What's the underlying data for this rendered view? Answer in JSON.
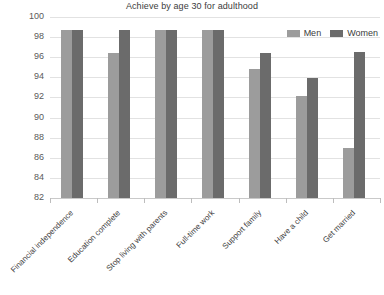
{
  "chart_data": {
    "type": "bar",
    "title": "Achieve by age 30 for adulthood",
    "xlabel": "",
    "ylabel": "",
    "ylim": [
      82,
      100
    ],
    "yticks": [
      82,
      84,
      86,
      88,
      90,
      92,
      94,
      96,
      98,
      100
    ],
    "grid": true,
    "legend_position": "top-right inside plot",
    "orientation": "vertical grouped",
    "categories": [
      "Financial independence",
      "Education complete",
      "Stop living with parents",
      "Full-time work",
      "Support family",
      "Have a child",
      "Get married"
    ],
    "series": [
      {
        "name": "Men",
        "color": "#9c9c9c",
        "values": [
          98.7,
          96.4,
          98.7,
          98.7,
          94.8,
          92.1,
          87.0
        ]
      },
      {
        "name": "Women",
        "color": "#6b6b6b",
        "values": [
          98.7,
          98.7,
          98.7,
          98.7,
          96.4,
          93.9,
          96.5
        ]
      }
    ]
  },
  "legend": {
    "items": [
      {
        "label": "Men",
        "swatch": "men-swatch"
      },
      {
        "label": "Women",
        "swatch": "women-swatch"
      }
    ]
  },
  "colors": {
    "men": "#9c9c9c",
    "women": "#6b6b6b",
    "gridline": "#e2e2e2",
    "axis": "#c9c9c9",
    "text": "#3c3c3c",
    "background": "#ffffff"
  }
}
